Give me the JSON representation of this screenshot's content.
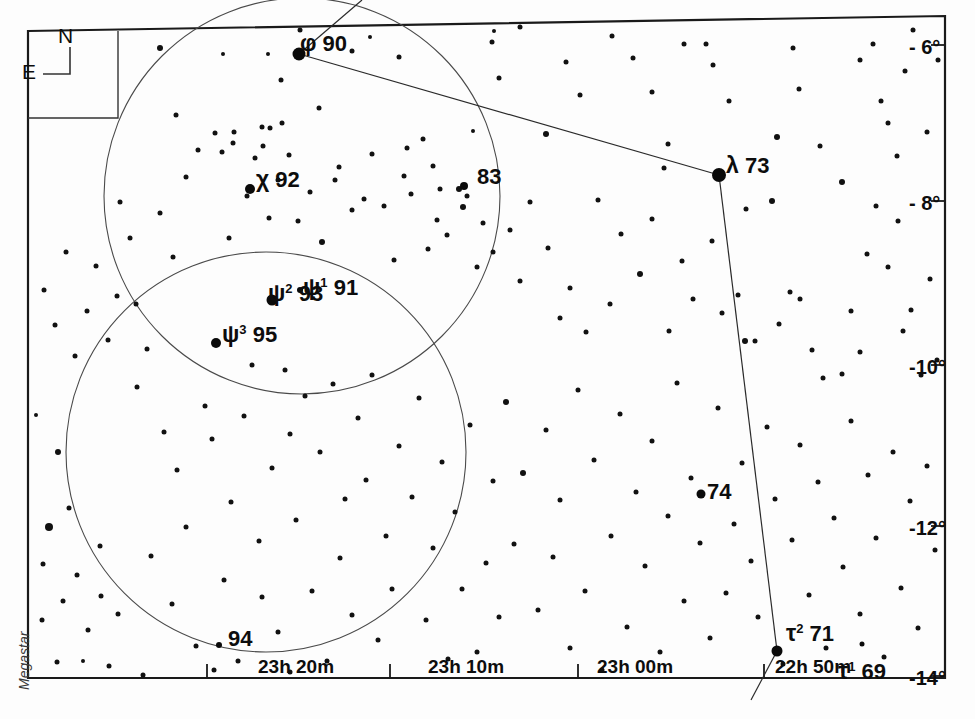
{
  "chart_data": {
    "type": "scatter",
    "credit": "Megastar",
    "compass": {
      "north": "N",
      "east": "E"
    },
    "xlabel": "Right Ascension",
    "ylabel": "Declination",
    "grid": false,
    "legend": "none",
    "xlim": [
      "23h 25m",
      "22h 45m"
    ],
    "ylim": [
      "-6°",
      "-14°"
    ],
    "ra_ticks": [
      {
        "label": "23h 20m",
        "x": 258,
        "tick_x": 207
      },
      {
        "label": "23h 10m",
        "x": 428,
        "tick_x": 390
      },
      {
        "label": "23h 00m",
        "x": 597,
        "tick_x": 578
      },
      {
        "label": "22h 50m",
        "x": 775,
        "tick_x": 764
      }
    ],
    "dec_ticks": [
      {
        "label": "- 6°",
        "y": 37,
        "tick_y": 45
      },
      {
        "label": "- 8°",
        "y": 193,
        "tick_y": 201
      },
      {
        "label": "-10°",
        "y": 357,
        "tick_y": 365
      },
      {
        "label": "-12°",
        "y": 518,
        "tick_y": 526
      },
      {
        "label": "-14°",
        "y": 668,
        "tick_y": 676
      }
    ],
    "named_stars": [
      {
        "greek": "φ",
        "sup": "",
        "flam": "90",
        "lx": 300,
        "ly": 32,
        "sx": 299,
        "sy": 54,
        "r": 6.5
      },
      {
        "greek": "λ",
        "sup": "",
        "flam": "73",
        "lx": 726,
        "ly": 154,
        "sx": 719,
        "sy": 175,
        "r": 7
      },
      {
        "greek": "χ",
        "sup": "",
        "flam": "92",
        "lx": 256,
        "ly": 168,
        "sx": 250,
        "sy": 189,
        "r": 5
      },
      {
        "greek": "",
        "sup": "",
        "flam": "83",
        "lx": 477,
        "ly": 166,
        "sx": 464,
        "sy": 186,
        "r": 4
      },
      {
        "greek": "ψ",
        "sup": "2",
        "flam": "93",
        "lx": 268,
        "ly": 282,
        "sx": 272,
        "sy": 300,
        "r": 5.5
      },
      {
        "greek": "ψ",
        "sup": "1",
        "flam": "91",
        "lx": 303,
        "ly": 276,
        "sx": 300,
        "sy": 290,
        "r": 3
      },
      {
        "greek": "ψ",
        "sup": "3",
        "flam": "95",
        "lx": 222,
        "ly": 323,
        "sx": 216,
        "sy": 343,
        "r": 5
      },
      {
        "greek": "",
        "sup": "",
        "flam": "74",
        "lx": 707,
        "ly": 481,
        "sx": 701,
        "sy": 494,
        "r": 4.5
      },
      {
        "greek": "",
        "sup": "",
        "flam": "94",
        "lx": 228,
        "ly": 628,
        "sx": 219,
        "sy": 645,
        "r": 3
      },
      {
        "greek": "τ",
        "sup": "2",
        "flam": "71",
        "lx": 786,
        "ly": 622,
        "sx": 777,
        "sy": 651,
        "r": 5.5
      },
      {
        "greek": "τ",
        "sup": "1",
        "flam": "69",
        "lx": 838,
        "ly": 660,
        "sx": 862,
        "sy": 644,
        "r": 2.5
      }
    ],
    "circles": [
      {
        "cx": 302,
        "cy": 196,
        "r": 198,
        "name": "upper-field-circle"
      },
      {
        "cx": 266,
        "cy": 452,
        "r": 200,
        "name": "lower-field-circle"
      }
    ],
    "constellation_lines": [
      {
        "from": [
          362,
          0
        ],
        "to": [
          299,
          54
        ]
      },
      {
        "from": [
          299,
          54
        ],
        "to": [
          719,
          175
        ]
      },
      {
        "from": [
          719,
          175
        ],
        "to": [
          777,
          651
        ]
      },
      {
        "from": [
          777,
          651
        ],
        "to": [
          751,
          700
        ]
      }
    ],
    "stars": [
      [
        49,
        527,
        4
      ],
      [
        43,
        564,
        2.5
      ],
      [
        63,
        601,
        2.5
      ],
      [
        83,
        661,
        2
      ],
      [
        36,
        415,
        2
      ],
      [
        29,
        383,
        2
      ],
      [
        160,
        48,
        3
      ],
      [
        176,
        115,
        2.5
      ],
      [
        215,
        133,
        2.5
      ],
      [
        223,
        54,
        2
      ],
      [
        233,
        143,
        2.5
      ],
      [
        262,
        127,
        2.5
      ],
      [
        268,
        54,
        2
      ],
      [
        281,
        80,
        2.5
      ],
      [
        300,
        30,
        2.5
      ],
      [
        319,
        108,
        2.5
      ],
      [
        352,
        51,
        2.5
      ],
      [
        370,
        37,
        2
      ],
      [
        382,
        18,
        2
      ],
      [
        399,
        57,
        2.5
      ],
      [
        407,
        148,
        2.5
      ],
      [
        423,
        139,
        2.5
      ],
      [
        433,
        166,
        2.5
      ],
      [
        440,
        189,
        2.5
      ],
      [
        463,
        207,
        3
      ],
      [
        473,
        131,
        2
      ],
      [
        492,
        42,
        2.5
      ],
      [
        494,
        31,
        2
      ],
      [
        499,
        78,
        2.5
      ],
      [
        520,
        27,
        2.5
      ],
      [
        546,
        134,
        3
      ],
      [
        566,
        62,
        2.5
      ],
      [
        580,
        95,
        2.5
      ],
      [
        596,
        21,
        2.5
      ],
      [
        606,
        23,
        2
      ],
      [
        612,
        36,
        2.5
      ],
      [
        633,
        58,
        2.5
      ],
      [
        652,
        92,
        2.5
      ],
      [
        664,
        168,
        2.5
      ],
      [
        668,
        144,
        2.5
      ],
      [
        684,
        44,
        2.5
      ],
      [
        700,
        18,
        2.5
      ],
      [
        706,
        44,
        2.5
      ],
      [
        713,
        65,
        2.5
      ],
      [
        729,
        101,
        2.5
      ],
      [
        746,
        209,
        2.5
      ],
      [
        777,
        137,
        3
      ],
      [
        793,
        48,
        2.5
      ],
      [
        799,
        89,
        2.5
      ],
      [
        820,
        146,
        2.5
      ],
      [
        842,
        182,
        3
      ],
      [
        860,
        60,
        2.5
      ],
      [
        873,
        44,
        2.5
      ],
      [
        881,
        101,
        2.5
      ],
      [
        888,
        123,
        2.5
      ],
      [
        897,
        156,
        2.5
      ],
      [
        905,
        71,
        2.5
      ],
      [
        913,
        30,
        2.5
      ],
      [
        927,
        132,
        2.5
      ],
      [
        938,
        60,
        2.5
      ],
      [
        945,
        193,
        2.5
      ],
      [
        130,
        238,
        2.5
      ],
      [
        136,
        304,
        2.5
      ],
      [
        147,
        349,
        2.5
      ],
      [
        120,
        202,
        2.5
      ],
      [
        160,
        213,
        2.5
      ],
      [
        173,
        257,
        2.5
      ],
      [
        186,
        177,
        2.5
      ],
      [
        198,
        150,
        2.5
      ],
      [
        222,
        152,
        2.5
      ],
      [
        229,
        238,
        2.5
      ],
      [
        234,
        132,
        2.5
      ],
      [
        247,
        196,
        2.5
      ],
      [
        255,
        158,
        2.5
      ],
      [
        263,
        146,
        2.5
      ],
      [
        269,
        218,
        2.5
      ],
      [
        278,
        180,
        2.5
      ],
      [
        270,
        128,
        2.5
      ],
      [
        282,
        123,
        2.5
      ],
      [
        289,
        155,
        2.5
      ],
      [
        298,
        221,
        2.5
      ],
      [
        310,
        192,
        2.5
      ],
      [
        322,
        242,
        3
      ],
      [
        335,
        180,
        2.5
      ],
      [
        339,
        167,
        2.5
      ],
      [
        352,
        210,
        2.5
      ],
      [
        364,
        199,
        2.5
      ],
      [
        372,
        154,
        2.5
      ],
      [
        384,
        206,
        2.5
      ],
      [
        394,
        260,
        2.5
      ],
      [
        404,
        176,
        2.5
      ],
      [
        411,
        194,
        2.5
      ],
      [
        428,
        249,
        2.5
      ],
      [
        437,
        220,
        2.5
      ],
      [
        447,
        235,
        2.5
      ],
      [
        459,
        189,
        3
      ],
      [
        467,
        196,
        2.5
      ],
      [
        477,
        267,
        2.5
      ],
      [
        483,
        223,
        2.5
      ],
      [
        493,
        252,
        2.5
      ],
      [
        510,
        230,
        2.5
      ],
      [
        520,
        281,
        2.5
      ],
      [
        530,
        202,
        2.5
      ],
      [
        548,
        248,
        2.5
      ],
      [
        560,
        318,
        2.5
      ],
      [
        570,
        288,
        2.5
      ],
      [
        586,
        332,
        2.5
      ],
      [
        598,
        200,
        2.5
      ],
      [
        610,
        304,
        2.5
      ],
      [
        621,
        234,
        2.5
      ],
      [
        640,
        274,
        3
      ],
      [
        652,
        219,
        2.5
      ],
      [
        669,
        331,
        2.5
      ],
      [
        682,
        261,
        2.5
      ],
      [
        693,
        299,
        2.5
      ],
      [
        712,
        241,
        2.5
      ],
      [
        722,
        313,
        2.5
      ],
      [
        738,
        295,
        2.5
      ],
      [
        745,
        341,
        3
      ],
      [
        755,
        341,
        2.5
      ],
      [
        772,
        201,
        3
      ],
      [
        779,
        324,
        2.5
      ],
      [
        790,
        292,
        2.5
      ],
      [
        800,
        299,
        2.5
      ],
      [
        812,
        350,
        2.5
      ],
      [
        823,
        378,
        2.5
      ],
      [
        842,
        374,
        2.5
      ],
      [
        851,
        311,
        2.5
      ],
      [
        860,
        352,
        2.5
      ],
      [
        867,
        254,
        2.5
      ],
      [
        876,
        206,
        2.5
      ],
      [
        888,
        267,
        2.5
      ],
      [
        898,
        221,
        2.5
      ],
      [
        903,
        331,
        2.5
      ],
      [
        911,
        310,
        2.5
      ],
      [
        921,
        375,
        2.5
      ],
      [
        930,
        279,
        2.5
      ],
      [
        937,
        360,
        2.5
      ],
      [
        947,
        314,
        2.5
      ],
      [
        137,
        387,
        2.5
      ],
      [
        151,
        556,
        2.5
      ],
      [
        164,
        432,
        2.5
      ],
      [
        172,
        604,
        2.5
      ],
      [
        177,
        470,
        2.5
      ],
      [
        186,
        527,
        2.5
      ],
      [
        196,
        646,
        2.5
      ],
      [
        205,
        406,
        2.5
      ],
      [
        212,
        439,
        2.5
      ],
      [
        224,
        580,
        2.5
      ],
      [
        231,
        502,
        2.5
      ],
      [
        238,
        661,
        2.5
      ],
      [
        244,
        416,
        2.5
      ],
      [
        252,
        365,
        2.5
      ],
      [
        259,
        541,
        2.5
      ],
      [
        262,
        597,
        2.5
      ],
      [
        272,
        468,
        2.5
      ],
      [
        278,
        632,
        2.5
      ],
      [
        285,
        370,
        2.5
      ],
      [
        290,
        434,
        2.5
      ],
      [
        296,
        520,
        2.5
      ],
      [
        300,
        678,
        2.5
      ],
      [
        305,
        396,
        2.5
      ],
      [
        312,
        591,
        2.5
      ],
      [
        320,
        452,
        2.5
      ],
      [
        327,
        661,
        2.5
      ],
      [
        333,
        384,
        2.5
      ],
      [
        340,
        558,
        2.5
      ],
      [
        345,
        499,
        2.5
      ],
      [
        352,
        615,
        2.5
      ],
      [
        358,
        418,
        2.5
      ],
      [
        366,
        480,
        2.5
      ],
      [
        372,
        375,
        2.5
      ],
      [
        378,
        640,
        2.5
      ],
      [
        386,
        536,
        2.5
      ],
      [
        392,
        589,
        2.5
      ],
      [
        399,
        446,
        2.5
      ],
      [
        404,
        676,
        2.5
      ],
      [
        412,
        497,
        2.5
      ],
      [
        419,
        398,
        2.5
      ],
      [
        426,
        620,
        2.5
      ],
      [
        433,
        548,
        2.5
      ],
      [
        442,
        462,
        2.5
      ],
      [
        448,
        659,
        2.5
      ],
      [
        455,
        512,
        2.5
      ],
      [
        462,
        589,
        2.5
      ],
      [
        470,
        425,
        2.5
      ],
      [
        477,
        652,
        2.5
      ],
      [
        486,
        563,
        2.5
      ],
      [
        493,
        481,
        2.5
      ],
      [
        499,
        617,
        2.5
      ],
      [
        506,
        402,
        3
      ],
      [
        514,
        544,
        2.5
      ],
      [
        523,
        473,
        3
      ],
      [
        531,
        679,
        2.5
      ],
      [
        538,
        610,
        2.5
      ],
      [
        546,
        430,
        2.5
      ],
      [
        553,
        557,
        2.5
      ],
      [
        560,
        500,
        2.5
      ],
      [
        570,
        648,
        2.5
      ],
      [
        578,
        390,
        2.5
      ],
      [
        585,
        591,
        2.5
      ],
      [
        594,
        460,
        2.5
      ],
      [
        602,
        670,
        2.5
      ],
      [
        611,
        536,
        2.5
      ],
      [
        620,
        414,
        2.5
      ],
      [
        627,
        627,
        2.5
      ],
      [
        636,
        492,
        2.5
      ],
      [
        645,
        566,
        2.5
      ],
      [
        652,
        441,
        2.5
      ],
      [
        660,
        652,
        2.5
      ],
      [
        668,
        516,
        2.5
      ],
      [
        677,
        383,
        2.5
      ],
      [
        684,
        601,
        2.5
      ],
      [
        691,
        478,
        2.5
      ],
      [
        700,
        543,
        2.5
      ],
      [
        710,
        638,
        2.5
      ],
      [
        718,
        408,
        2.5
      ],
      [
        726,
        593,
        2.5
      ],
      [
        734,
        524,
        2.5
      ],
      [
        742,
        463,
        2.5
      ],
      [
        751,
        561,
        2.5
      ],
      [
        758,
        617,
        2.5
      ],
      [
        767,
        427,
        2.5
      ],
      [
        775,
        499,
        2.5
      ],
      [
        783,
        664,
        2.5
      ],
      [
        792,
        540,
        2.5
      ],
      [
        800,
        445,
        2.5
      ],
      [
        809,
        595,
        2.5
      ],
      [
        818,
        482,
        2.5
      ],
      [
        826,
        648,
        2.5
      ],
      [
        834,
        518,
        2.5
      ],
      [
        843,
        567,
        2.5
      ],
      [
        851,
        421,
        2.5
      ],
      [
        860,
        614,
        2.5
      ],
      [
        868,
        475,
        2.5
      ],
      [
        876,
        538,
        2.5
      ],
      [
        884,
        657,
        2.5
      ],
      [
        893,
        452,
        2.5
      ],
      [
        901,
        588,
        2.5
      ],
      [
        910,
        501,
        2.5
      ],
      [
        918,
        628,
        2.5
      ],
      [
        927,
        466,
        2.5
      ],
      [
        935,
        550,
        2.5
      ],
      [
        944,
        604,
        2.5
      ],
      [
        951,
        490,
        2.5
      ],
      [
        947,
        436,
        2.5
      ],
      [
        101,
        596,
        2.5
      ],
      [
        58,
        452,
        3
      ],
      [
        69,
        508,
        2.5
      ],
      [
        88,
        630,
        2.5
      ],
      [
        118,
        614,
        2.5
      ],
      [
        100,
        546,
        2.5
      ],
      [
        77,
        575,
        2.5
      ],
      [
        42,
        620,
        2.5
      ],
      [
        57,
        662,
        2.5
      ],
      [
        109,
        666,
        2.5
      ],
      [
        143,
        675,
        2.5
      ],
      [
        180,
        683,
        2.5
      ],
      [
        214,
        670,
        2.5
      ],
      [
        247,
        686,
        2.5
      ],
      [
        290,
        672,
        2.5
      ],
      [
        117,
        296,
        2.5
      ],
      [
        108,
        340,
        2.5
      ],
      [
        96,
        266,
        2.5
      ],
      [
        87,
        311,
        2.5
      ],
      [
        75,
        356,
        2.5
      ],
      [
        66,
        252,
        2.5
      ],
      [
        55,
        325,
        2.5
      ],
      [
        44,
        290,
        2.5
      ]
    ]
  }
}
